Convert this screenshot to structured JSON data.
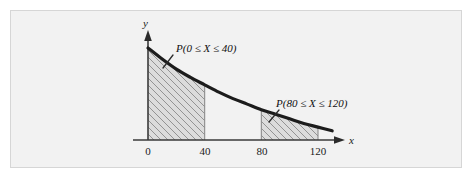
{
  "figure": {
    "frame_border_color": "#d6d6d6",
    "plot_background_color": "#f2f2f2",
    "page_background_color": "#ffffff",
    "curve_color": "#1c1c1c",
    "hatch_color": "#8a8a8a",
    "shade_fill_color": "#dcdcdc"
  },
  "axes": {
    "x_axis_name": "x",
    "y_axis_name": "y",
    "x_tick_labels": [
      "0",
      "40",
      "80",
      "120"
    ],
    "x_tick_values": [
      0,
      40,
      80,
      120
    ]
  },
  "annotations": {
    "region1_label": "P(0 ≤ X ≤ 40)",
    "region2_label": "P(80 ≤ X ≤ 120)"
  },
  "chart_data": {
    "type": "area",
    "title": "",
    "subtitle": "",
    "xlabel": "x",
    "ylabel": "y",
    "xlim": [
      -10,
      140
    ],
    "ylim": [
      0,
      1
    ],
    "grid": false,
    "legend": "none",
    "curve_description": "exponential decay probability density function",
    "series": [
      {
        "name": "density",
        "x": [
          0,
          10,
          20,
          30,
          40,
          50,
          60,
          70,
          80,
          90,
          100,
          110,
          120,
          130
        ],
        "values": [
          1.0,
          0.88,
          0.77,
          0.68,
          0.6,
          0.52,
          0.45,
          0.39,
          0.33,
          0.28,
          0.23,
          0.18,
          0.14,
          0.1
        ]
      }
    ],
    "shaded_regions": [
      {
        "label": "P(0 ≤ X ≤ 40)",
        "x_start": 0,
        "x_end": 40,
        "hatched": true
      },
      {
        "label": "P(80 ≤ X ≤ 120)",
        "x_start": 80,
        "x_end": 120,
        "hatched": true
      }
    ],
    "annotations": [
      {
        "text": "P(0 ≤ X ≤ 40)",
        "x": 30,
        "y": 0.86
      },
      {
        "text": "P(80 ≤ X ≤ 120)",
        "x": 100,
        "y": 0.45
      }
    ]
  }
}
